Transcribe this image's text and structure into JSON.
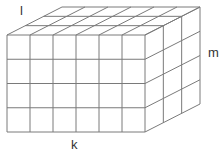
{
  "diagram": {
    "type": "rectangular-prism-of-unit-cubes",
    "dimensions": {
      "length_cells": 6,
      "height_cells": 4,
      "depth_cells": 3
    },
    "labels": {
      "length": "k",
      "height": "m",
      "depth": "l"
    },
    "colors": {
      "stroke": "#7a7a7a",
      "background": "#ffffff",
      "text": "#333333"
    }
  }
}
